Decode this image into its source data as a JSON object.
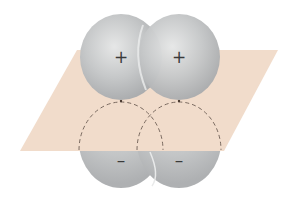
{
  "diagram": {
    "plane": {
      "color": "#f1dccb",
      "description": "nodal plane"
    },
    "orbital_color": "#bfc1c2",
    "lobes": [
      {
        "id": "upper-left",
        "phase": "+",
        "sign_label": "+"
      },
      {
        "id": "upper-right",
        "phase": "+",
        "sign_label": "+"
      },
      {
        "id": "lower-left",
        "phase": "-",
        "sign_label": "–"
      },
      {
        "id": "lower-right",
        "phase": "-",
        "sign_label": "–"
      }
    ],
    "dashed_outline_color": "#7a6a60"
  }
}
